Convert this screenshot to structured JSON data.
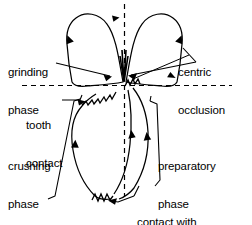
{
  "figure": {
    "kind": "line-diagram",
    "title_text": "",
    "stroke_color": "#000000",
    "background_color": "#ffffff",
    "dashed_axis_color": "#000000"
  },
  "labels": {
    "grinding_phase": {
      "line1": "grinding",
      "line2": "phase"
    },
    "centric_occlusion": {
      "line1": "centric",
      "line2": "occlusion"
    },
    "tooth_contact": {
      "line1": "tooth",
      "line2": "contact"
    },
    "crushing_phase": {
      "line1": "crushing",
      "line2": "phase"
    },
    "preparatory_phase": {
      "line1": "preparatory",
      "line2": "phase"
    },
    "contact_with_food_bolus": {
      "line1": "contact with",
      "line2": "food bolus"
    }
  },
  "icons": {
    "arrowhead": "arrowhead-icon",
    "zigzag": "zigzag-icon",
    "dashed_vertical_axis": "dashed-vertical-axis-icon",
    "dashed_horizontal_axis": "dashed-horizontal-axis-icon",
    "bracket_left": "bracket-left-icon",
    "bracket_right": "bracket-right-icon"
  }
}
